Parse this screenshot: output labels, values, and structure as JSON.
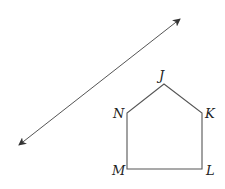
{
  "diagram": {
    "type": "geometry-figure",
    "stroke_color": "#444444",
    "line": {
      "description": "line with arrows at both ends",
      "start": [
        19,
        145
      ],
      "end": [
        180,
        19
      ]
    },
    "pentagon": {
      "vertices": [
        {
          "name": "J",
          "point": [
            164,
            84
          ]
        },
        {
          "name": "K",
          "point": [
            202,
            113
          ]
        },
        {
          "name": "L",
          "point": [
            202,
            169
          ]
        },
        {
          "name": "M",
          "point": [
            127,
            169
          ]
        },
        {
          "name": "N",
          "point": [
            127,
            113
          ]
        }
      ]
    },
    "labels": {
      "J": "J",
      "K": "K",
      "L": "L",
      "M": "M",
      "N": "N"
    }
  }
}
